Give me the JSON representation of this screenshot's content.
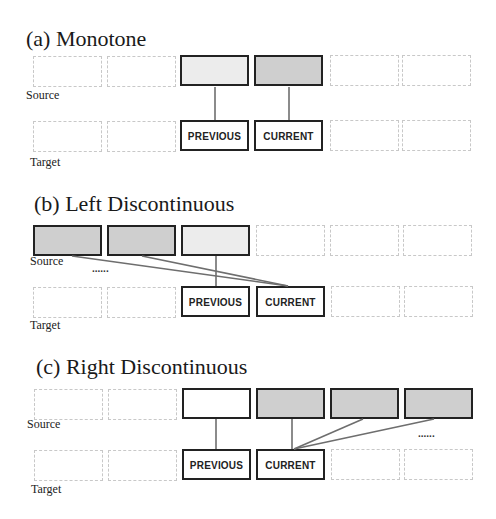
{
  "panels": [
    {
      "id": "a",
      "title": "(a)  Monotone",
      "source_label": "Source",
      "target_label": "Target",
      "source_boxes": [
        "ghost",
        "ghost",
        "bold-light",
        "bold-gray",
        "ghost",
        "ghost"
      ],
      "target_boxes": [
        "ghost",
        "ghost",
        "PREVIOUS",
        "CURRENT",
        "ghost",
        "ghost"
      ],
      "links": [
        {
          "from_source": 3,
          "to_target": 3
        },
        {
          "from_source": 4,
          "to_target": 4
        }
      ],
      "ellipsis": ""
    },
    {
      "id": "b",
      "title": "(b) Left Discontinuous",
      "source_label": "Source",
      "target_label": "Target",
      "source_boxes": [
        "bold-gray",
        "bold-gray",
        "bold-light",
        "ghost",
        "ghost",
        "ghost"
      ],
      "target_boxes": [
        "ghost",
        "ghost",
        "PREVIOUS",
        "CURRENT",
        "ghost",
        "ghost"
      ],
      "links": [
        {
          "from_source": 3,
          "to_target": 3
        },
        {
          "from_source": 1,
          "to_target": 4
        },
        {
          "from_source": 2,
          "to_target": 4
        }
      ],
      "ellipsis": "......"
    },
    {
      "id": "c",
      "title": "(c)  Right Discontinuous",
      "source_label": "Source",
      "target_label": "Target",
      "source_boxes": [
        "ghost",
        "ghost",
        "bold-white",
        "bold-gray",
        "bold-gray",
        "bold-gray"
      ],
      "target_boxes": [
        "ghost",
        "ghost",
        "PREVIOUS",
        "CURRENT",
        "ghost",
        "ghost"
      ],
      "links": [
        {
          "from_source": 3,
          "to_target": 3
        },
        {
          "from_source": 4,
          "to_target": 4
        },
        {
          "from_source": 5,
          "to_target": 4
        },
        {
          "from_source": 6,
          "to_target": 4
        }
      ],
      "ellipsis": "......"
    }
  ],
  "labels": {
    "previous": "PREVIOUS",
    "current": "CURRENT"
  },
  "colors": {
    "bold_border": "#222222",
    "ghost_border": "#c8c8c8",
    "fill_light": "#ececec",
    "fill_gray": "#cfcfcf",
    "link": "#6e6e6e"
  }
}
